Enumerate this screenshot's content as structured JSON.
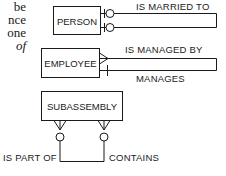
{
  "prose_fragments": [
    "be",
    "nce",
    "one",
    "of"
  ],
  "entities": {
    "person": "PERSON",
    "employee": "EMPLOYEE",
    "subassembly": "SUBASSEMBLY"
  },
  "relationships": {
    "marriage": {
      "label": "IS MARRIED TO",
      "cardinality": "optional one to optional one (recursive)"
    },
    "management": {
      "label_top": "IS MANAGED BY",
      "label_bottom": "MANAGES",
      "cardinality": "many to one (recursive)"
    },
    "assembly": {
      "label_left": "IS PART OF",
      "label_right": "CONTAINS",
      "cardinality": "optional many to optional many (recursive)"
    }
  },
  "colors": {
    "ink": "#1a1a1a",
    "background": "#ffffff"
  }
}
